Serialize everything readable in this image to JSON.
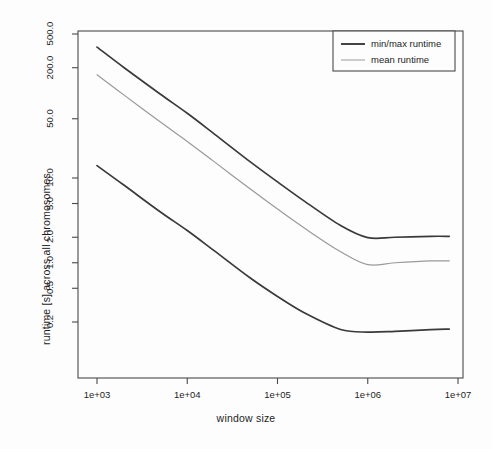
{
  "chart_data": {
    "type": "line",
    "title": "",
    "xlabel": "window size",
    "ylabel": "runtime [s] across all chromosomes",
    "xscale": "log",
    "yscale": "log",
    "xlim": [
      1000,
      10000000
    ],
    "ylim": [
      0.13,
      600
    ],
    "grid": false,
    "legend_position": "top-right",
    "xticks": [
      {
        "value": 1000,
        "label": "1e+03"
      },
      {
        "value": 10000,
        "label": "1e+04"
      },
      {
        "value": 100000,
        "label": "1e+05"
      },
      {
        "value": 1000000,
        "label": "1e+06"
      },
      {
        "value": 10000000,
        "label": "1e+07"
      }
    ],
    "yticks": [
      {
        "value": 500.0,
        "label": "500.0"
      },
      {
        "value": 200.0,
        "label": "200.0"
      },
      {
        "value": 50.0,
        "label": "50.0"
      },
      {
        "value": 10.0,
        "label": "10.0"
      },
      {
        "value": 5.0,
        "label": "5.0"
      },
      {
        "value": 2.0,
        "label": "2.0"
      },
      {
        "value": 1.0,
        "label": "1.0"
      },
      {
        "value": 0.5,
        "label": "0.5"
      },
      {
        "value": 0.2,
        "label": "0.2"
      }
    ],
    "x": [
      1000,
      2000,
      5000,
      10000,
      20000,
      50000,
      100000,
      200000,
      500000,
      1000000,
      2000000,
      5000000,
      8000000
    ],
    "series": [
      {
        "name": "max runtime",
        "legend_key": "min/max runtime",
        "color": "#3a3a3a",
        "width": 1.7,
        "values": [
          350.0,
          200.0,
          98.0,
          58.0,
          33.0,
          15.5,
          9.0,
          5.3,
          2.75,
          1.98,
          2.0,
          2.05,
          2.05
        ]
      },
      {
        "name": "mean runtime",
        "legend_key": "mean runtime",
        "color": "#9a9a9a",
        "width": 1.2,
        "values": [
          165.0,
          95.0,
          46.0,
          27.0,
          15.5,
          7.4,
          4.3,
          2.55,
          1.35,
          0.95,
          1.0,
          1.05,
          1.05
        ]
      },
      {
        "name": "min runtime",
        "legend_key": "min/max runtime",
        "color": "#3a3a3a",
        "width": 1.7,
        "values": [
          14.0,
          8.2,
          4.0,
          2.4,
          1.38,
          0.66,
          0.4,
          0.255,
          0.163,
          0.152,
          0.155,
          0.163,
          0.165
        ]
      }
    ],
    "legend": [
      {
        "label": "min/max runtime",
        "color": "#3a3a3a",
        "width": 1.9
      },
      {
        "label": "mean runtime",
        "color": "#a5a5a5",
        "width": 1.1
      }
    ],
    "axis_color": "#4a4a4a",
    "background": "#fdfdfd"
  }
}
